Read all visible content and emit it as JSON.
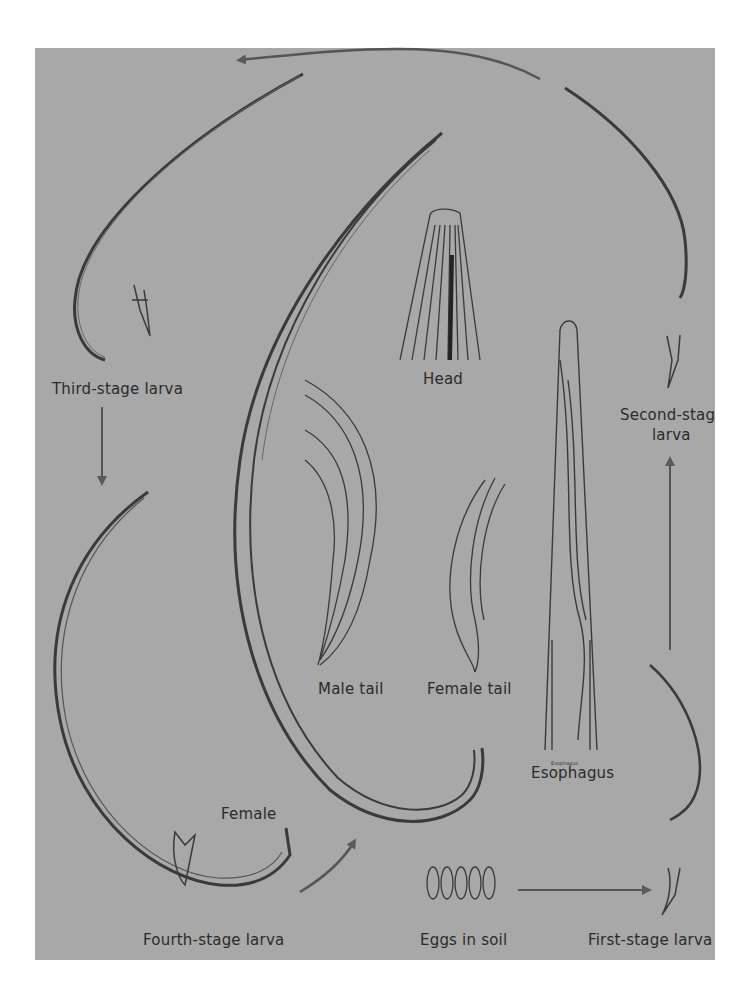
{
  "diagram": {
    "type": "life-cycle",
    "background_color": "#a8a8a8",
    "line_color": "#3a3a3a",
    "arrow_color": "#555555"
  },
  "labels": {
    "third_stage": "Third-stage larva",
    "second_stage_line1": "Second-stag",
    "second_stage_line2": "larva",
    "head": "Head",
    "male_tail": "Male tail",
    "female_tail": "Female tail",
    "esophagus": "Esophagus",
    "esophagus_small": "Esophagus",
    "female": "Female",
    "fourth_stage": "Fourth-stage larva",
    "eggs": "Eggs in soil",
    "first_stage": "First-stage larva"
  },
  "cycle_sequence": [
    "Eggs in soil",
    "First-stage larva",
    "Second-stage larva",
    "Third-stage larva",
    "Fourth-stage larva",
    "Female"
  ]
}
